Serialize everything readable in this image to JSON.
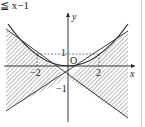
{
  "header_fragment": "≦ x−1",
  "axes": {
    "x_label": "x",
    "y_label": "y",
    "origin_label": "O"
  },
  "ticks": {
    "x_neg": "−2",
    "x_pos": "2",
    "y_pos": "1",
    "y_neg": "−1"
  },
  "curves": [
    {
      "name": "parabola",
      "equation": "y = x²/4"
    },
    {
      "name": "line-1",
      "equation": "y = x − 1"
    },
    {
      "name": "line-2",
      "equation": "y = −x − 1"
    }
  ],
  "shaded_regions": "left and right wedges between lines y=x−1 and y=−x−1",
  "colors": {
    "stroke": "#222222",
    "hatch": "#555555"
  }
}
